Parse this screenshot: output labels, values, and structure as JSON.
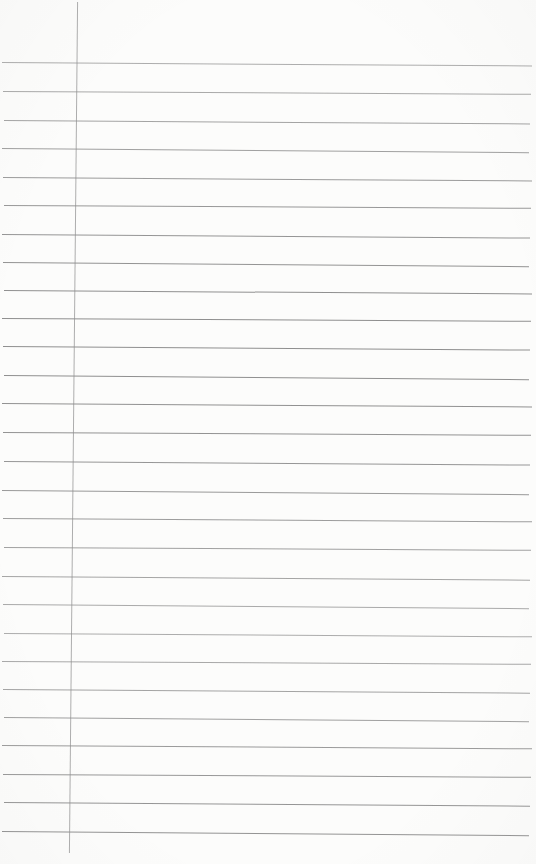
{
  "page": {
    "kind": "blank-ruled-notebook-page-scan",
    "background_color": "#fcfcfb",
    "width_px": 536,
    "height_px": 864,
    "visible_text": ""
  },
  "ruling": {
    "line_count": 28,
    "first_line_y_px": 62,
    "line_spacing_px": 28.5,
    "line_left_px": 2,
    "line_right_px": 532,
    "line_color": "#8f8f8f"
  },
  "margin_line": {
    "center_x_px": 73,
    "top_px": 2,
    "bottom_px": 853,
    "color": "#adadad"
  }
}
